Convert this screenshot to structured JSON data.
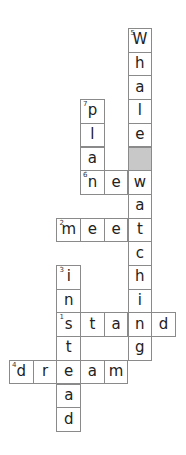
{
  "puzzle": {
    "type": "crossword",
    "grid": {
      "origin_x": 9,
      "origin_y": 28,
      "cell_size": 23.7,
      "cols": 7,
      "rows": 17,
      "blocked_color": "#c8c8c8",
      "border_color": "#8a8a8a"
    },
    "cells": [
      {
        "r": 0,
        "c": 5,
        "ch": "W",
        "num": "5"
      },
      {
        "r": 1,
        "c": 5,
        "ch": "h"
      },
      {
        "r": 2,
        "c": 5,
        "ch": "a"
      },
      {
        "r": 3,
        "c": 3,
        "ch": "p",
        "num": "7"
      },
      {
        "r": 3,
        "c": 5,
        "ch": "l"
      },
      {
        "r": 4,
        "c": 3,
        "ch": "l"
      },
      {
        "r": 4,
        "c": 5,
        "ch": "e"
      },
      {
        "r": 5,
        "c": 3,
        "ch": "a"
      },
      {
        "r": 5,
        "c": 5,
        "ch": "",
        "blocked": true
      },
      {
        "r": 6,
        "c": 3,
        "ch": "n",
        "num": "6"
      },
      {
        "r": 6,
        "c": 4,
        "ch": "e"
      },
      {
        "r": 6,
        "c": 5,
        "ch": "w"
      },
      {
        "r": 7,
        "c": 5,
        "ch": "a"
      },
      {
        "r": 8,
        "c": 2,
        "ch": "m",
        "num": "2"
      },
      {
        "r": 8,
        "c": 3,
        "ch": "e"
      },
      {
        "r": 8,
        "c": 4,
        "ch": "e"
      },
      {
        "r": 8,
        "c": 5,
        "ch": "t"
      },
      {
        "r": 9,
        "c": 5,
        "ch": "c"
      },
      {
        "r": 10,
        "c": 2,
        "ch": "i",
        "num": "3"
      },
      {
        "r": 10,
        "c": 5,
        "ch": "h"
      },
      {
        "r": 11,
        "c": 2,
        "ch": "n"
      },
      {
        "r": 11,
        "c": 5,
        "ch": "i"
      },
      {
        "r": 12,
        "c": 2,
        "ch": "s",
        "num": "1"
      },
      {
        "r": 12,
        "c": 3,
        "ch": "t"
      },
      {
        "r": 12,
        "c": 4,
        "ch": "a"
      },
      {
        "r": 12,
        "c": 5,
        "ch": "n"
      },
      {
        "r": 12,
        "c": 6,
        "ch": "d"
      },
      {
        "r": 13,
        "c": 2,
        "ch": "t"
      },
      {
        "r": 13,
        "c": 5,
        "ch": "g"
      },
      {
        "r": 14,
        "c": 0,
        "ch": "d",
        "num": "4"
      },
      {
        "r": 14,
        "c": 1,
        "ch": "r"
      },
      {
        "r": 14,
        "c": 2,
        "ch": "e"
      },
      {
        "r": 14,
        "c": 3,
        "ch": "a"
      },
      {
        "r": 14,
        "c": 4,
        "ch": "m"
      },
      {
        "r": 15,
        "c": 2,
        "ch": "a"
      },
      {
        "r": 16,
        "c": 2,
        "ch": "d"
      }
    ],
    "words": [
      {
        "num": "1",
        "dir": "across",
        "answer": "stand"
      },
      {
        "num": "2",
        "dir": "across",
        "answer": "meet"
      },
      {
        "num": "3",
        "dir": "down",
        "answer": "instead"
      },
      {
        "num": "4",
        "dir": "across",
        "answer": "dream"
      },
      {
        "num": "5",
        "dir": "down",
        "answer": "Whale watching"
      },
      {
        "num": "6",
        "dir": "across",
        "answer": "new"
      },
      {
        "num": "7",
        "dir": "down",
        "answer": "plan"
      }
    ]
  }
}
